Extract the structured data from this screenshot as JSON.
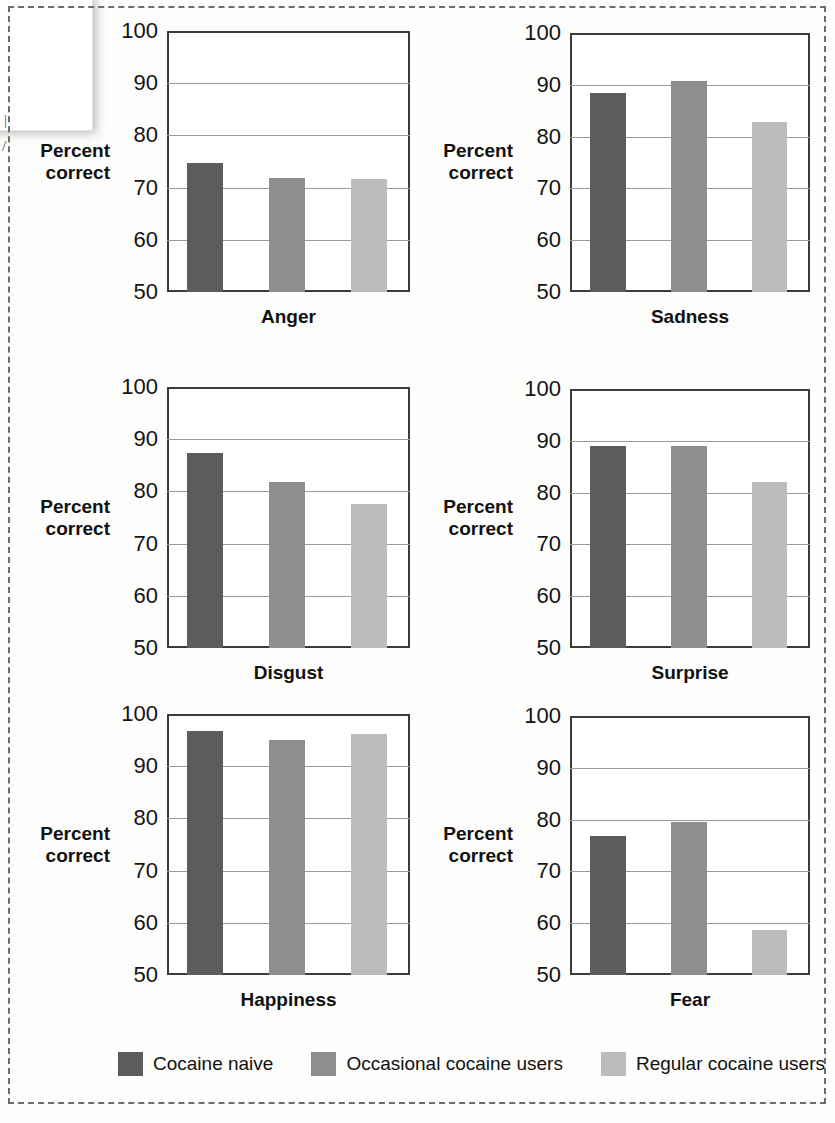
{
  "chart_data": {
    "type": "bar",
    "title": "",
    "xlabel": "",
    "ylabel": "Percent correct",
    "ylim": [
      50,
      100
    ],
    "yticks": [
      50,
      60,
      70,
      80,
      90,
      100
    ],
    "grid": true,
    "legend_position": "bottom",
    "categories": [
      "Anger",
      "Sadness",
      "Disgust",
      "Surprise",
      "Happiness",
      "Fear"
    ],
    "series": [
      {
        "name": "Cocaine naive",
        "color": "#5c5c5c",
        "values": [
          74.8,
          88.5,
          87.3,
          89.0,
          96.8,
          76.8
        ]
      },
      {
        "name": "Occasional cocaine users",
        "color": "#8e8e8e",
        "values": [
          71.9,
          90.7,
          81.8,
          89.0,
          95.0,
          79.6
        ]
      },
      {
        "name": "Regular cocaine users",
        "color": "#bcbcbc",
        "values": [
          71.6,
          82.8,
          77.5,
          82.0,
          96.2,
          58.7
        ]
      }
    ],
    "panels": [
      {
        "category": "Anger",
        "axis_title_line1": "Percent",
        "axis_title_line2": "correct",
        "values": [
          74.8,
          71.9,
          71.6
        ]
      },
      {
        "category": "Sadness",
        "axis_title_line1": "Percent",
        "axis_title_line2": "correct",
        "values": [
          88.5,
          90.7,
          82.8
        ]
      },
      {
        "category": "Disgust",
        "axis_title_line1": "Percent",
        "axis_title_line2": "correct",
        "values": [
          87.3,
          81.8,
          77.5
        ]
      },
      {
        "category": "Surprise",
        "axis_title_line1": "Percent",
        "axis_title_line2": "correct",
        "values": [
          89.0,
          89.0,
          82.0
        ]
      },
      {
        "category": "Happiness",
        "axis_title_line1": "Percent",
        "axis_title_line2": "correct",
        "values": [
          96.8,
          95.0,
          96.2
        ]
      },
      {
        "category": "Fear",
        "axis_title_line1": "Percent",
        "axis_title_line2": "correct",
        "values": [
          76.8,
          79.6,
          58.7
        ]
      }
    ]
  },
  "legend": {
    "items": [
      {
        "label": "Cocaine naive",
        "color": "#5c5c5c"
      },
      {
        "label": "Occasional cocaine users",
        "color": "#8e8e8e"
      },
      {
        "label": "Regular cocaine users",
        "color": "#bcbcbc"
      }
    ]
  },
  "axis": {
    "tick_100": "100",
    "tick_90": "90",
    "tick_80": "80",
    "tick_70": "70",
    "tick_60": "60",
    "tick_50": "50"
  },
  "artifacts": {
    "edge_mark_1": "|",
    "edge_mark_2": "/"
  }
}
